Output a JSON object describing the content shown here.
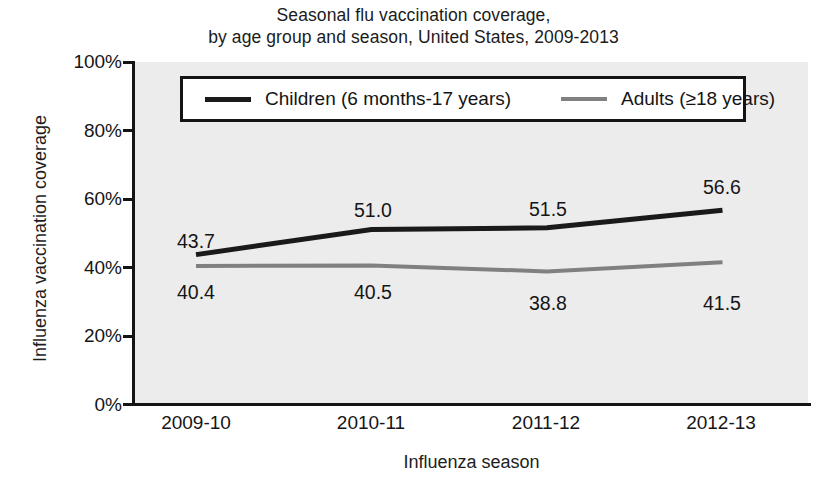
{
  "chart_data": {
    "type": "line",
    "title": "Seasonal flu vaccination coverage, by age group and season, United States, 2009-2013",
    "title_lines": [
      "Seasonal flu vaccination coverage,",
      "by age group and season, United States, 2009-2013"
    ],
    "xlabel": "Influenza season",
    "ylabel": "Influenza vaccination coverage",
    "categories": [
      "2009-10",
      "2010-11",
      "2011-12",
      "2012-13"
    ],
    "ylim": [
      0,
      100
    ],
    "yticks": [
      0,
      20,
      40,
      60,
      80,
      100
    ],
    "ytick_labels": [
      "0%",
      "20%",
      "40%",
      "60%",
      "80%",
      "100%"
    ],
    "grid": false,
    "legend_position": "top-center-inside",
    "series": [
      {
        "name": "Children (6 months-17 years)",
        "color": "#1a1a1a",
        "values": [
          43.7,
          51.0,
          51.5,
          56.6
        ],
        "labels": [
          "43.7",
          "51.0",
          "51.5",
          "56.6"
        ],
        "label_position": "above"
      },
      {
        "name": "Adults (≥18 years)",
        "color": "#808080",
        "values": [
          40.4,
          40.5,
          38.8,
          41.5
        ],
        "labels": [
          "40.4",
          "40.5",
          "38.8",
          "41.5"
        ],
        "label_position": "below"
      }
    ]
  },
  "colors": {
    "plot_background": "#ececec",
    "page_background": "#ffffff",
    "axis": "#141414",
    "children_series": "#1a1a1a",
    "adults_series": "#808080",
    "text": "#151515"
  }
}
